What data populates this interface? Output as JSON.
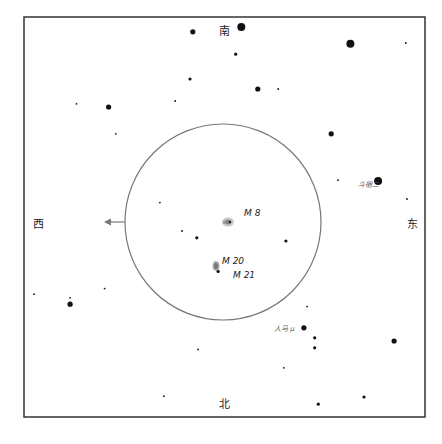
{
  "chart_data": {
    "type": "scatter",
    "title": "",
    "directions": {
      "top": "南",
      "bottom": "北",
      "left": "西",
      "right": "东"
    },
    "field_circle": {
      "arrow_direction": "西"
    },
    "deep_sky_objects": [
      {
        "name": "M 8",
        "type": "nebula"
      },
      {
        "name": "M 20",
        "type": "nebula"
      },
      {
        "name": "M 21",
        "type": "cluster"
      }
    ],
    "named_stars": [
      {
        "name": "斗宿二",
        "magnitude_class": "bright"
      },
      {
        "name": "人马 μ",
        "magnitude_class": "bright"
      }
    ],
    "stars": [
      {
        "x": 0.421,
        "y": 0.037,
        "mag": 2
      },
      {
        "x": 0.542,
        "y": 0.025,
        "mag": 1
      },
      {
        "x": 0.814,
        "y": 0.067,
        "mag": 1
      },
      {
        "x": 0.528,
        "y": 0.093,
        "mag": 3
      },
      {
        "x": 0.952,
        "y": 0.065,
        "mag": 4
      },
      {
        "x": 0.414,
        "y": 0.155,
        "mag": 3
      },
      {
        "x": 0.377,
        "y": 0.21,
        "mag": 4
      },
      {
        "x": 0.211,
        "y": 0.225,
        "mag": 2
      },
      {
        "x": 0.131,
        "y": 0.217,
        "mag": 4
      },
      {
        "x": 0.634,
        "y": 0.18,
        "mag": 4
      },
      {
        "x": 0.583,
        "y": 0.18,
        "mag": 2
      },
      {
        "x": 0.229,
        "y": 0.292,
        "mag": 4
      },
      {
        "x": 0.766,
        "y": 0.292,
        "mag": 2
      },
      {
        "x": 0.783,
        "y": 0.408,
        "mag": 4
      },
      {
        "x": 0.883,
        "y": 0.41,
        "mag": 1,
        "label": "斗宿二"
      },
      {
        "x": 0.955,
        "y": 0.455,
        "mag": 4
      },
      {
        "x": 0.339,
        "y": 0.464,
        "mag": 4
      },
      {
        "x": 0.5,
        "y": 0.513,
        "mag": 3
      },
      {
        "x": 0.431,
        "y": 0.552,
        "mag": 3
      },
      {
        "x": 0.394,
        "y": 0.535,
        "mag": 4
      },
      {
        "x": 0.653,
        "y": 0.56,
        "mag": 3
      },
      {
        "x": 0.484,
        "y": 0.636,
        "mag": 3
      },
      {
        "x": 0.201,
        "y": 0.679,
        "mag": 4
      },
      {
        "x": 0.115,
        "y": 0.702,
        "mag": 4
      },
      {
        "x": 0.025,
        "y": 0.693,
        "mag": 4
      },
      {
        "x": 0.115,
        "y": 0.718,
        "mag": 2
      },
      {
        "x": 0.706,
        "y": 0.724,
        "mag": 4
      },
      {
        "x": 0.698,
        "y": 0.777,
        "mag": 2,
        "label": "人马 μ"
      },
      {
        "x": 0.725,
        "y": 0.802,
        "mag": 3
      },
      {
        "x": 0.725,
        "y": 0.827,
        "mag": 3
      },
      {
        "x": 0.923,
        "y": 0.81,
        "mag": 2
      },
      {
        "x": 0.648,
        "y": 0.877,
        "mag": 4
      },
      {
        "x": 0.434,
        "y": 0.831,
        "mag": 4
      },
      {
        "x": 0.349,
        "y": 0.948,
        "mag": 4
      },
      {
        "x": 0.734,
        "y": 0.968,
        "mag": 3
      },
      {
        "x": 0.848,
        "y": 0.95,
        "mag": 3
      }
    ]
  }
}
